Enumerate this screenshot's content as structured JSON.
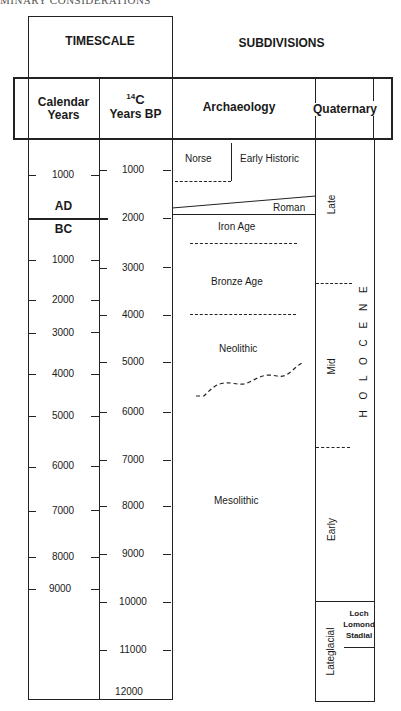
{
  "running_head": "MINARY CONSIDERATIONS",
  "headers": {
    "timescale": "TIMESCALE",
    "subdivisions": "SUBDIVISIONS",
    "calendar_line1": "Calendar",
    "calendar_line2": "Years",
    "c14_sup": "14",
    "c14_line1": "C",
    "c14_line2": "Years BP",
    "archaeology": "Archaeology",
    "quaternary": "Quaternary"
  },
  "calendar_years": {
    "ad_label": "AD",
    "bc_label": "BC",
    "ticks": [
      {
        "label": "1000",
        "era": "AD"
      },
      {
        "label": "1000",
        "era": "BC"
      },
      {
        "label": "2000",
        "era": "BC"
      },
      {
        "label": "3000",
        "era": "BC"
      },
      {
        "label": "4000",
        "era": "BC"
      },
      {
        "label": "5000",
        "era": "BC"
      },
      {
        "label": "6000",
        "era": "BC"
      },
      {
        "label": "7000",
        "era": "BC"
      },
      {
        "label": "8000",
        "era": "BC"
      },
      {
        "label": "9000",
        "era": "BC"
      }
    ]
  },
  "c14_years": {
    "ticks": [
      "1000",
      "2000",
      "3000",
      "4000",
      "5000",
      "6000",
      "7000",
      "8000",
      "9000",
      "10000",
      "11000",
      "12000"
    ]
  },
  "archaeology": {
    "periods": [
      "Norse",
      "Early Historic",
      "Roman",
      "Iron Age",
      "Bronze Age",
      "Neolithic",
      "Mesolithic"
    ]
  },
  "quaternary": {
    "epoch": "H O L O C E N E",
    "epoch_letters": [
      "H",
      "O",
      "L",
      "O",
      "C",
      "E",
      "N",
      "E"
    ],
    "holocene_divisions": [
      "Late",
      "Mid",
      "Early"
    ],
    "lateglacial": "Lateglacial",
    "stadial_line1": "Loch",
    "stadial_line2": "Lomond",
    "stadial_line3": "Stadial"
  }
}
